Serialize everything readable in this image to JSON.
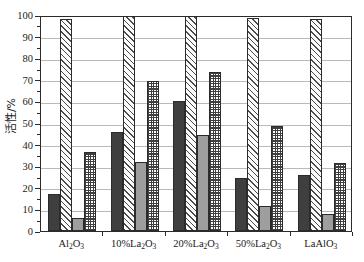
{
  "chart_data": {
    "type": "bar",
    "title": "",
    "subtitle": "",
    "xlabel": "",
    "ylabel": "活性/%",
    "ylim": [
      0,
      100
    ],
    "ytick_step": 10,
    "yminor_step": 5,
    "grid": true,
    "legend": "none",
    "categories": [
      "Al2O3",
      "10%La2O3",
      "20%La2O3",
      "50%La2O3",
      "LaAlO3"
    ],
    "category_labels_html": [
      "Al<sub>2</sub>O<sub>3</sub>",
      "10%La<sub>2</sub>O<sub>3</sub>",
      "20%La<sub>2</sub>O<sub>3</sub>",
      "50%La<sub>2</sub>O<sub>3</sub>",
      "LaAlO<sub>3</sub>"
    ],
    "ytick_labels": [
      "0",
      "10",
      "20",
      "30",
      "40",
      "50",
      "60",
      "70",
      "80",
      "90",
      "100"
    ],
    "series": [
      {
        "name": "series-1",
        "style": "dark",
        "color": "#3f3f3f",
        "values": [
          17,
          46,
          60,
          24.5,
          26
        ]
      },
      {
        "name": "series-2",
        "style": "hatch",
        "color": "#fbfbfb",
        "values": [
          98,
          100,
          100,
          98.5,
          98
        ]
      },
      {
        "name": "series-3",
        "style": "gray",
        "color": "#9e9e9e",
        "values": [
          6,
          32,
          44.5,
          11.5,
          8
        ]
      },
      {
        "name": "series-4",
        "style": "cross",
        "color": "#ffffff",
        "values": [
          36.5,
          69.5,
          73.5,
          48.5,
          31.5
        ]
      }
    ]
  }
}
